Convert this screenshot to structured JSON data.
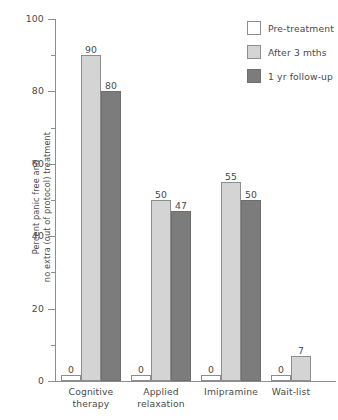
{
  "chart_data": {
    "type": "bar",
    "title": "",
    "xlabel": "",
    "ylabel_line1": "Percent panic free and",
    "ylabel_line2": "no extra (out of protocol) treatment",
    "ylim": [
      0,
      100
    ],
    "ytick_labels": [
      "0",
      "20",
      "40",
      "60",
      "80",
      "100"
    ],
    "ytick_values": [
      0,
      20,
      40,
      60,
      80,
      100
    ],
    "yminor_values": [
      10,
      30,
      50,
      70,
      90
    ],
    "grid": false,
    "legend_position": "top-right",
    "categories": [
      {
        "line1": "Cognitive",
        "line2": "therapy"
      },
      {
        "line1": "Applied",
        "line2": "relaxation"
      },
      {
        "line1": "Imipramine",
        "line2": ""
      },
      {
        "line1": "Wait-list",
        "line2": ""
      }
    ],
    "series": [
      {
        "name": "Pre-treatment",
        "key": "pre",
        "color": "#ffffff",
        "values": [
          0,
          0,
          0,
          0
        ]
      },
      {
        "name": "After 3 mths",
        "key": "after",
        "color": "#d4d4d4",
        "values": [
          90,
          50,
          55,
          7
        ]
      },
      {
        "name": "1 yr follow-up",
        "key": "follow",
        "color": "#7c7c7c",
        "values": [
          80,
          47,
          50,
          null
        ]
      }
    ],
    "value_labels": [
      [
        "0",
        "90",
        "80"
      ],
      [
        "0",
        "50",
        "47"
      ],
      [
        "0",
        "55",
        "50"
      ],
      [
        "0",
        "7",
        null
      ]
    ]
  },
  "legend": {
    "items": [
      {
        "label": "Pre-treatment",
        "swatch": "pre"
      },
      {
        "label": "After 3 mths",
        "swatch": "after"
      },
      {
        "label": "1 yr follow-up",
        "swatch": "follow"
      }
    ]
  }
}
